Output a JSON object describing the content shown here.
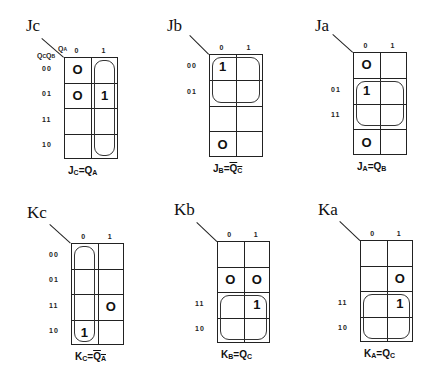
{
  "kmaps": [
    {
      "id": "jc",
      "title": "Jc",
      "col_var": "QA",
      "row_var": "QcQB",
      "col_headers": [
        "0",
        "1"
      ],
      "row_headers": [
        "00",
        "01",
        "11",
        "10"
      ],
      "cells": [
        [
          "O",
          ""
        ],
        [
          "O",
          "1"
        ],
        [
          "",
          ""
        ],
        [
          "",
          ""
        ]
      ],
      "equation": {
        "lhs": "J",
        "lhs_sub": "C",
        "op": "=",
        "rhs": "Q",
        "rhs_sub": "A",
        "rhs_bar": false
      },
      "equation_text": "JC= QA",
      "loop": {
        "rows": [
          0,
          3
        ],
        "cols": [
          1,
          1
        ]
      },
      "geom": {
        "x": 64,
        "y": 57,
        "w": 54,
        "h": 102,
        "title_x": 26,
        "title_y": 16,
        "diag_x": 42,
        "diag_y": 38
      }
    },
    {
      "id": "jb",
      "title": "Jb",
      "col_var": "",
      "row_var": "",
      "col_headers": [
        "0",
        "1"
      ],
      "row_headers": [
        "00",
        "01",
        "",
        ""
      ],
      "cells": [
        [
          "1",
          ""
        ],
        [
          "",
          ""
        ],
        [
          "",
          ""
        ],
        [
          "O",
          ""
        ]
      ],
      "equation": {
        "lhs": "J",
        "lhs_sub": "B",
        "op": "=",
        "rhs": "Q",
        "rhs_sub": "C",
        "rhs_bar": true
      },
      "equation_text": "JB=QC",
      "loop": {
        "rows": [
          0,
          1
        ],
        "cols": [
          0,
          1
        ]
      },
      "geom": {
        "x": 209,
        "y": 54,
        "w": 54,
        "h": 103,
        "title_x": 167,
        "title_y": 16,
        "diag_x": 190,
        "diag_y": 35
      }
    },
    {
      "id": "ja",
      "title": "Ja",
      "col_var": "",
      "row_var": "",
      "col_headers": [
        "0",
        "1"
      ],
      "row_headers": [
        "",
        "01",
        "11",
        ""
      ],
      "cells": [
        [
          "O",
          ""
        ],
        [
          "1",
          ""
        ],
        [
          "",
          ""
        ],
        [
          "O",
          ""
        ]
      ],
      "equation": {
        "lhs": "J",
        "lhs_sub": "A",
        "op": "=",
        "rhs": "Q",
        "rhs_sub": "B",
        "rhs_bar": false
      },
      "equation_text": "JA=QB",
      "loop": {
        "rows": [
          1,
          2
        ],
        "cols": [
          0,
          1
        ]
      },
      "geom": {
        "x": 353,
        "y": 52,
        "w": 54,
        "h": 103,
        "title_x": 315,
        "title_y": 16,
        "diag_x": 333,
        "diag_y": 34
      }
    },
    {
      "id": "kc",
      "title": "Kc",
      "col_var": "",
      "row_var": "",
      "col_headers": [
        "0",
        "1"
      ],
      "row_headers": [
        "00",
        "01",
        "11",
        "10"
      ],
      "cells": [
        [
          "",
          ""
        ],
        [
          "",
          ""
        ],
        [
          "",
          "O"
        ],
        [
          "1",
          ""
        ]
      ],
      "equation": {
        "lhs": "K",
        "lhs_sub": "C",
        "op": "=",
        "rhs": "Q",
        "rhs_sub": "A",
        "rhs_bar": true
      },
      "equation_text": "KC=QA",
      "loop": {
        "rows": [
          0,
          3
        ],
        "cols": [
          0,
          0
        ]
      },
      "geom": {
        "x": 71,
        "y": 243,
        "w": 53,
        "h": 102,
        "title_x": 27,
        "title_y": 203,
        "diag_x": 50,
        "diag_y": 224
      }
    },
    {
      "id": "kb",
      "title": "Kb",
      "col_var": "",
      "row_var": "",
      "col_headers": [
        "0",
        "1"
      ],
      "row_headers": [
        "",
        "",
        "11",
        "10"
      ],
      "cells": [
        [
          "",
          ""
        ],
        [
          "O",
          "O"
        ],
        [
          "",
          "1"
        ],
        [
          "",
          ""
        ]
      ],
      "equation": {
        "lhs": "K",
        "lhs_sub": "B",
        "op": "=",
        "rhs": "Q",
        "rhs_sub": "C",
        "rhs_bar": false
      },
      "equation_text": "KB=QC",
      "loop": {
        "rows": [
          2,
          3
        ],
        "cols": [
          0,
          1
        ]
      },
      "geom": {
        "x": 217,
        "y": 241,
        "w": 53,
        "h": 102,
        "title_x": 174,
        "title_y": 200,
        "diag_x": 197,
        "diag_y": 222
      }
    },
    {
      "id": "ka",
      "title": "Ka",
      "col_var": "",
      "row_var": "",
      "col_headers": [
        "0",
        "1"
      ],
      "row_headers": [
        "",
        "",
        "11",
        "10"
      ],
      "cells": [
        [
          "",
          ""
        ],
        [
          "",
          "O"
        ],
        [
          "",
          "1"
        ],
        [
          "",
          ""
        ]
      ],
      "equation": {
        "lhs": "K",
        "lhs_sub": "A",
        "op": "=",
        "rhs": "Q",
        "rhs_sub": "C",
        "rhs_bar": false
      },
      "equation_text": "KA=QC",
      "loop": {
        "rows": [
          2,
          3
        ],
        "cols": [
          0,
          1
        ]
      },
      "geom": {
        "x": 360,
        "y": 240,
        "w": 53,
        "h": 102,
        "title_x": 318,
        "title_y": 200,
        "diag_x": 340,
        "diag_y": 221
      }
    }
  ]
}
